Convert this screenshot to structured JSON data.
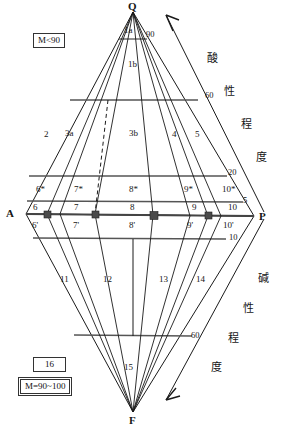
{
  "diagram": {
    "vertices": [
      {
        "name": "Q",
        "label": "Q",
        "x": 133,
        "y": 6
      },
      {
        "name": "A",
        "label": "A",
        "x": 6,
        "y": 209
      },
      {
        "name": "P",
        "label": "P",
        "x": 259,
        "y": 212
      },
      {
        "name": "F",
        "label": "F",
        "x": 129,
        "y": 416
      }
    ],
    "zones_upper": [
      {
        "label": "1a",
        "x": 124,
        "y": 28
      },
      {
        "label": "1b",
        "x": 128,
        "y": 62
      },
      {
        "label": "2",
        "x": 44,
        "y": 131
      },
      {
        "label": "3a",
        "x": 66,
        "y": 130
      },
      {
        "label": "3b",
        "x": 132,
        "y": 130
      },
      {
        "label": "4",
        "x": 172,
        "y": 131
      },
      {
        "label": "5",
        "x": 195,
        "y": 131
      }
    ],
    "zones_star": [
      {
        "label": "6*",
        "x": 38,
        "y": 186
      },
      {
        "label": "7*",
        "x": 76,
        "y": 186
      },
      {
        "label": "8*",
        "x": 131,
        "y": 186
      },
      {
        "label": "9*",
        "x": 186,
        "y": 186
      },
      {
        "label": "10*",
        "x": 225,
        "y": 186
      }
    ],
    "zones_plain": [
      {
        "label": "6",
        "x": 32,
        "y": 205
      },
      {
        "label": "7",
        "x": 74,
        "y": 205
      },
      {
        "label": "8",
        "x": 131,
        "y": 205
      },
      {
        "label": "9",
        "x": 194,
        "y": 205
      },
      {
        "label": "10",
        "x": 230,
        "y": 205
      }
    ],
    "zones_prime": [
      {
        "label": "6'",
        "x": 32,
        "y": 223
      },
      {
        "label": "7'",
        "x": 74,
        "y": 223
      },
      {
        "label": "8'",
        "x": 131,
        "y": 223
      },
      {
        "label": "9'",
        "x": 189,
        "y": 223
      },
      {
        "label": "10'",
        "x": 226,
        "y": 223
      }
    ],
    "zones_lower": [
      {
        "label": "11",
        "x": 62,
        "y": 276
      },
      {
        "label": "12",
        "x": 105,
        "y": 276
      },
      {
        "label": "13",
        "x": 160,
        "y": 276
      },
      {
        "label": "14",
        "x": 198,
        "y": 276
      },
      {
        "label": "15",
        "x": 126,
        "y": 364
      }
    ],
    "ticks": [
      {
        "label": "90",
        "x": 146,
        "y": 31
      },
      {
        "label": "60",
        "x": 207,
        "y": 92
      },
      {
        "label": "20",
        "x": 229,
        "y": 169
      },
      {
        "label": "5",
        "x": 245,
        "y": 198
      },
      {
        "label": "10",
        "x": 231,
        "y": 234
      },
      {
        "label": "60",
        "x": 192,
        "y": 332
      }
    ],
    "axis_labels_acid": [
      "酸",
      "性",
      "程",
      "度"
    ],
    "axis_labels_alkali": [
      "碱",
      "性",
      "程",
      "度"
    ],
    "boxes": [
      {
        "name": "m-less-90",
        "label": "M<90",
        "x": 33,
        "y": 33
      },
      {
        "name": "zone-16",
        "label": "16",
        "x": 33,
        "y": 357
      },
      {
        "name": "m-90-100",
        "label": "M=90~100",
        "x": 19,
        "y": 379
      }
    ],
    "colors": {
      "line": "#1a1a1a",
      "grid": "#555555",
      "text": "#161616",
      "background": "#ffffff"
    }
  }
}
